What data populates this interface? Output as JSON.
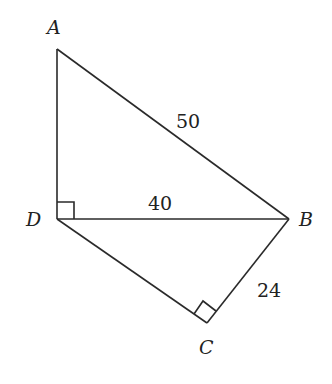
{
  "diagram": {
    "type": "geometry",
    "vertices": [
      {
        "name": "A",
        "x": 57,
        "y": 49,
        "label_x": 47,
        "label_y": 34
      },
      {
        "name": "D",
        "x": 57,
        "y": 219,
        "label_x": 27,
        "label_y": 226
      },
      {
        "name": "B",
        "x": 289,
        "y": 219,
        "label_x": 299,
        "label_y": 226
      },
      {
        "name": "C",
        "x": 207,
        "y": 323,
        "label_x": 200,
        "label_y": 354
      }
    ],
    "segments": [
      {
        "from": "A",
        "to": "D"
      },
      {
        "from": "A",
        "to": "B",
        "length": "50"
      },
      {
        "from": "D",
        "to": "B",
        "length": "40"
      },
      {
        "from": "D",
        "to": "C"
      },
      {
        "from": "C",
        "to": "B",
        "length": "24"
      }
    ],
    "labels": {
      "A": "A",
      "B": "B",
      "C": "C",
      "D": "D",
      "AB": "50",
      "DB": "40",
      "CB": "24"
    },
    "right_angles": [
      "ADB",
      "DCB"
    ]
  }
}
